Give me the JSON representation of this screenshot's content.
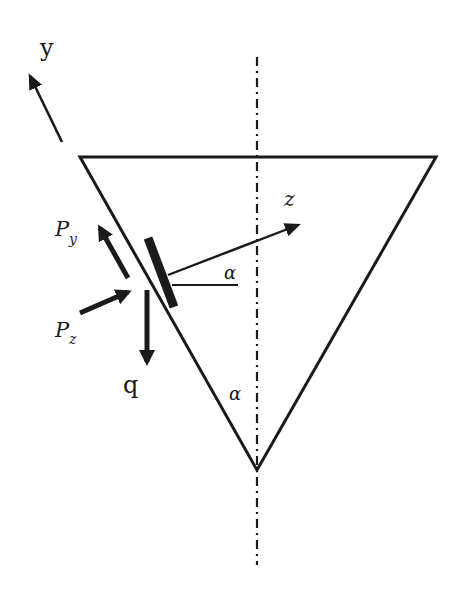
{
  "diagram": {
    "title": "",
    "colors": {
      "stroke": "#1a1a1a",
      "background": "#ffffff"
    },
    "labels": {
      "y_axis": "y",
      "z_axis": "z",
      "alpha_upper": "α",
      "alpha_apex": "α",
      "py_main": "P",
      "py_sub": "y",
      "pz_main": "P",
      "pz_sub": "z",
      "q": "q"
    },
    "shapes": {
      "triangle": {
        "points": [
          [
            80,
            157
          ],
          [
            436,
            157
          ],
          [
            257,
            470
          ]
        ]
      },
      "centerline": {
        "x": 257,
        "y1": 57,
        "y2": 565,
        "style": "dash-dot"
      },
      "plate": {
        "from": [
          147,
          240
        ],
        "to": [
          173,
          307
        ]
      }
    },
    "arrows": [
      {
        "name": "y-axis",
        "from": [
          62,
          142
        ],
        "to": [
          28,
          72
        ]
      },
      {
        "name": "z-axis",
        "from": [
          168,
          277
        ],
        "to": [
          300,
          224
        ]
      },
      {
        "name": "force-py",
        "from": [
          128,
          277
        ],
        "to": [
          97,
          222
        ]
      },
      {
        "name": "force-pz",
        "from": [
          80,
          313
        ],
        "to": [
          133,
          289
        ]
      },
      {
        "name": "load-q",
        "from": [
          147,
          290
        ],
        "to": [
          147,
          366
        ]
      }
    ]
  }
}
